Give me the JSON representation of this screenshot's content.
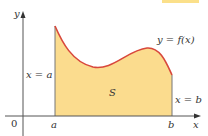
{
  "figure": {
    "type": "area-under-curve",
    "labels": {
      "y_axis": "y",
      "x_axis": "x",
      "origin": "0",
      "a": "a",
      "b": "b",
      "left_bound": "x = a",
      "right_bound": "x = b",
      "function": "y = f(x)",
      "region": "S"
    },
    "colors": {
      "fill": "#FBDC8E",
      "curve": "#D8483C",
      "axis": "#555555",
      "bound_line": "#777777",
      "top_tab": "#FBE08A"
    }
  }
}
